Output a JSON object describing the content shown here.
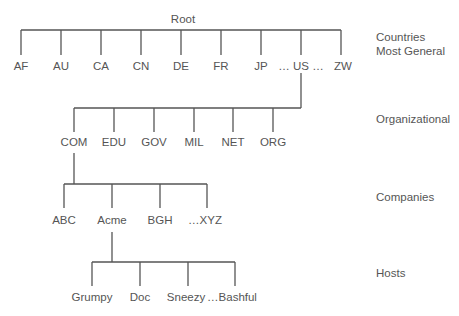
{
  "root": {
    "label": "Root"
  },
  "levels": [
    {
      "label_lines": [
        "Countries",
        "Most General"
      ]
    },
    {
      "label_lines": [
        "Organizational"
      ]
    },
    {
      "label_lines": [
        "Companies"
      ]
    },
    {
      "label_lines": [
        "Hosts"
      ]
    }
  ],
  "countries": [
    "AF",
    "AU",
    "CA",
    "CN",
    "DE",
    "FR",
    "JP",
    "… US …",
    "ZW"
  ],
  "organizational": [
    "COM",
    "EDU",
    "GOV",
    "MIL",
    "NET",
    "ORG"
  ],
  "companies": [
    "ABC",
    "Acme",
    "BGH",
    "…XYZ"
  ],
  "hosts": [
    "Grumpy",
    "Doc",
    "Sneezy",
    "…Bashful"
  ],
  "colors": {
    "line": "#555555",
    "text": "#555555",
    "background": "#ffffff"
  }
}
